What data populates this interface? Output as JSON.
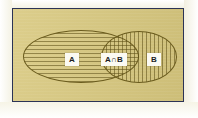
{
  "figure": {
    "type": "venn-diagram",
    "title": "",
    "universal_set": {
      "label": "",
      "border_color": "#2b3356",
      "fill_color": "#d8c87e"
    },
    "sets": [
      {
        "id": "A",
        "label": "A",
        "hatch": "horizontal",
        "outline_color": "#6b5c1e"
      },
      {
        "id": "B",
        "label": "B",
        "hatch": "vertical",
        "outline_color": "#6b5c1e"
      }
    ],
    "regions": [
      {
        "id": "a-only",
        "label": "A"
      },
      {
        "id": "intersection",
        "label": "A∩B"
      },
      {
        "id": "b-only",
        "label": "B"
      }
    ],
    "colors": {
      "page_background": "#fbfaef",
      "universe_fill": "#d8c87e",
      "frame": "#2b3356",
      "hatch": "#5a4c14",
      "label_background": "#fbfaf2",
      "label_text": "#1d1d1d"
    }
  }
}
